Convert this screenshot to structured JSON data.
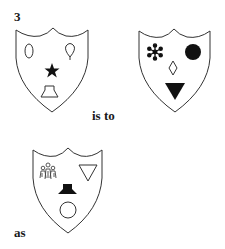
{
  "question": {
    "number": "3",
    "connector_1": "is to",
    "connector_2": "as"
  },
  "colors": {
    "stroke": "#333333",
    "fill_solid": "#111111",
    "background": "#ffffff"
  },
  "shields": [
    {
      "id": "shield-1",
      "position": "top-left",
      "symbols": [
        {
          "name": "oval",
          "style": "outline",
          "location": "upper-left"
        },
        {
          "name": "teardrop-balloon",
          "style": "outline",
          "location": "upper-right"
        },
        {
          "name": "star",
          "style": "filled",
          "location": "center"
        },
        {
          "name": "trapezoid",
          "style": "outline",
          "location": "bottom"
        }
      ]
    },
    {
      "id": "shield-2",
      "position": "top-right",
      "symbols": [
        {
          "name": "asterisk-flower",
          "style": "filled",
          "location": "upper-left"
        },
        {
          "name": "circle",
          "style": "filled",
          "location": "upper-right"
        },
        {
          "name": "diamond",
          "style": "outline",
          "location": "center"
        },
        {
          "name": "triangle-down",
          "style": "filled",
          "location": "bottom"
        }
      ]
    },
    {
      "id": "shield-3",
      "position": "bottom-left",
      "symbols": [
        {
          "name": "figures-group",
          "style": "outline",
          "location": "upper-left"
        },
        {
          "name": "triangle-down",
          "style": "outline",
          "location": "upper-right"
        },
        {
          "name": "trapezoid",
          "style": "filled",
          "location": "center"
        },
        {
          "name": "circle",
          "style": "outline",
          "location": "bottom"
        }
      ]
    }
  ]
}
